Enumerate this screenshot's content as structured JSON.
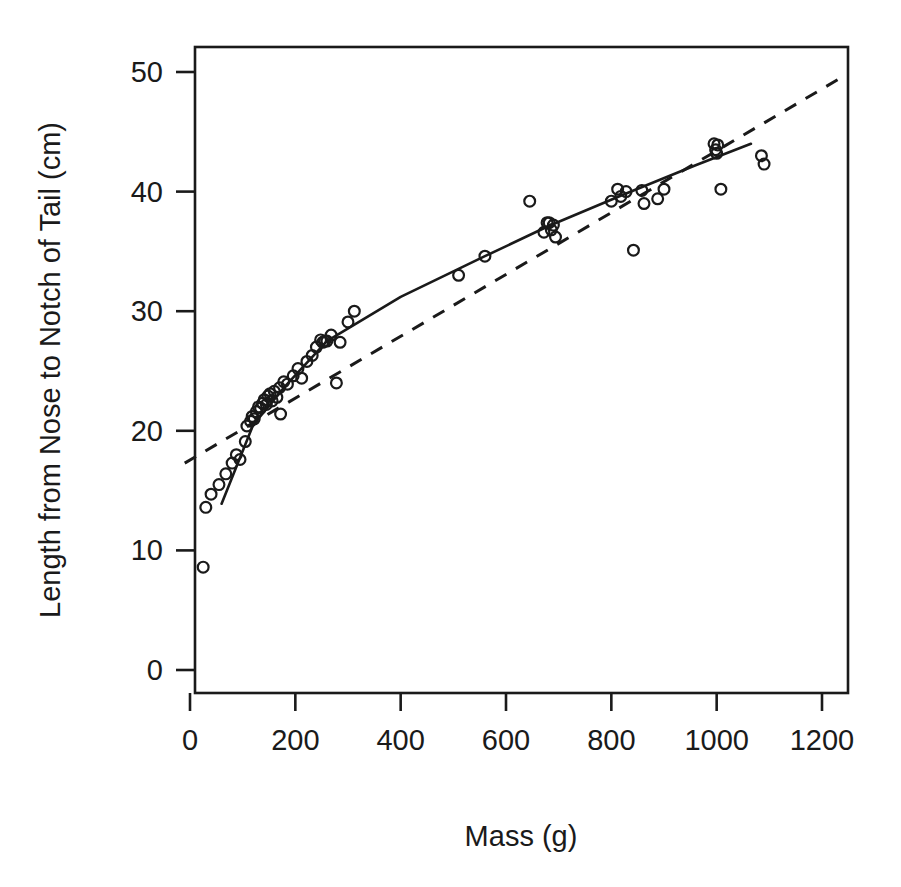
{
  "chart_data": {
    "type": "scatter",
    "title": "",
    "xlabel": "Mass (g)",
    "ylabel": "Length from Nose to Notch of Tail (cm)",
    "xlim": [
      -10,
      1247
    ],
    "ylim": [
      -2.0,
      52.3
    ],
    "grid": false,
    "legend": "none",
    "x_ticks": [
      0,
      200,
      400,
      600,
      800,
      1000,
      1200
    ],
    "x_tick_labels": [
      "0",
      "200",
      "400",
      "600",
      "800",
      "1000",
      "1200"
    ],
    "y_ticks": [
      0,
      10,
      20,
      30,
      40,
      50
    ],
    "y_tick_labels": [
      "0",
      "10",
      "20",
      "30",
      "40",
      "50"
    ],
    "marker": "open-circle",
    "marker_color": "#1a1a1a",
    "points": [
      [
        25,
        8.6
      ],
      [
        30,
        13.6
      ],
      [
        40,
        14.7
      ],
      [
        55,
        15.5
      ],
      [
        68,
        16.4
      ],
      [
        80,
        17.3
      ],
      [
        88,
        18.0
      ],
      [
        95,
        17.6
      ],
      [
        105,
        19.1
      ],
      [
        108,
        20.4
      ],
      [
        115,
        20.8
      ],
      [
        118,
        21.2
      ],
      [
        122,
        21.0
      ],
      [
        126,
        21.6
      ],
      [
        130,
        22.0
      ],
      [
        134,
        21.9
      ],
      [
        138,
        22.3
      ],
      [
        141,
        22.6
      ],
      [
        145,
        22.2
      ],
      [
        148,
        22.9
      ],
      [
        152,
        23.1
      ],
      [
        156,
        22.5
      ],
      [
        160,
        23.3
      ],
      [
        165,
        22.8
      ],
      [
        170,
        23.6
      ],
      [
        172,
        21.4
      ],
      [
        178,
        24.1
      ],
      [
        185,
        23.9
      ],
      [
        196,
        24.6
      ],
      [
        205,
        25.2
      ],
      [
        212,
        24.4
      ],
      [
        222,
        25.8
      ],
      [
        232,
        26.3
      ],
      [
        240,
        27.0
      ],
      [
        248,
        27.6
      ],
      [
        252,
        27.4
      ],
      [
        256,
        27.5
      ],
      [
        260,
        27.5
      ],
      [
        268,
        28.0
      ],
      [
        278,
        24.0
      ],
      [
        285,
        27.4
      ],
      [
        300,
        29.1
      ],
      [
        312,
        30.0
      ],
      [
        510,
        33.0
      ],
      [
        560,
        34.6
      ],
      [
        645,
        39.2
      ],
      [
        672,
        36.6
      ],
      [
        678,
        37.4
      ],
      [
        682,
        37.4
      ],
      [
        686,
        36.8
      ],
      [
        690,
        37.2
      ],
      [
        694,
        36.2
      ],
      [
        800,
        39.2
      ],
      [
        812,
        40.2
      ],
      [
        818,
        39.6
      ],
      [
        828,
        40.0
      ],
      [
        842,
        35.1
      ],
      [
        858,
        40.1
      ],
      [
        862,
        39.0
      ],
      [
        888,
        39.4
      ],
      [
        900,
        40.2
      ],
      [
        995,
        44.0
      ],
      [
        998,
        43.5
      ],
      [
        1000,
        43.2
      ],
      [
        1002,
        43.9
      ],
      [
        1008,
        40.2
      ],
      [
        1085,
        43.0
      ],
      [
        1090,
        42.3
      ]
    ],
    "series": [
      {
        "name": "segmented-fit",
        "style": "solid",
        "type": "line",
        "points": [
          [
            60,
            13.9
          ],
          [
            120,
            20.5
          ],
          [
            180,
            23.7
          ],
          [
            260,
            27.5
          ],
          [
            400,
            31.2
          ],
          [
            560,
            34.6
          ],
          [
            680,
            37.1
          ],
          [
            820,
            39.7
          ],
          [
            960,
            42.2
          ],
          [
            1065,
            44.0
          ]
        ]
      },
      {
        "name": "linear-fit",
        "style": "dashed",
        "type": "line",
        "points": [
          [
            -10,
            17.3
          ],
          [
            1247,
            49.8
          ]
        ]
      }
    ]
  },
  "axes": {
    "x_title": "Mass (g)",
    "y_title": "Length from Nose to Notch of Tail (cm)"
  }
}
